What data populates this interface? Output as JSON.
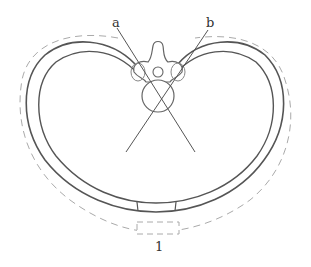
{
  "diagram": {
    "labels": {
      "a": "a",
      "b": "b",
      "one": "1"
    },
    "colors": {
      "line": "#555555",
      "dashed": "#aaaaaa",
      "background": "#ffffff"
    }
  }
}
